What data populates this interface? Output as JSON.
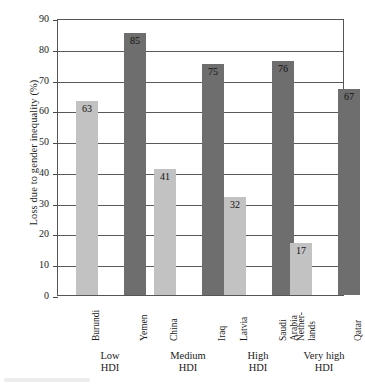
{
  "chart_data": {
    "type": "bar",
    "title": "",
    "xlabel": "",
    "ylabel": "Loss due to gender inequality (%)",
    "ylim": [
      0,
      90
    ],
    "ytick_step": 10,
    "yticks": [
      90,
      80,
      70,
      60,
      50,
      40,
      30,
      20,
      10,
      0
    ],
    "grid": true,
    "legend": "none",
    "categories": [
      "Burundi",
      "Yemen",
      "China",
      "Iraq",
      "Latvia",
      "Saudi\nArabia",
      "Nether-\nlands",
      "Qatar"
    ],
    "values": [
      63,
      85,
      41,
      75,
      32,
      76,
      17,
      67
    ],
    "bar_styles": [
      "light",
      "dark",
      "light",
      "dark",
      "light",
      "dark",
      "light",
      "dark"
    ],
    "groups": [
      {
        "label": "Low\nHDI",
        "categories": [
          "Burundi",
          "Yemen"
        ],
        "values": [
          63,
          85
        ]
      },
      {
        "label": "Medium\nHDI",
        "categories": [
          "China",
          "Iraq"
        ],
        "values": [
          41,
          75
        ]
      },
      {
        "label": "High\nHDI",
        "categories": [
          "Latvia",
          "Saudi Arabia"
        ],
        "values": [
          32,
          76
        ]
      },
      {
        "label": "Very high\nHDI",
        "categories": [
          "Netherlands",
          "Qatar"
        ],
        "values": [
          17,
          67
        ]
      }
    ],
    "colors": {
      "light_bar": "#c2c2c2",
      "dark_bar": "#6e6e6e",
      "axis": "#555555",
      "grid": "#5a5a5a",
      "text": "#1a1a1a",
      "background": "#ffffff"
    }
  },
  "axis": {
    "y_title": "Loss due to gender inequality (%)",
    "tick_labels": [
      "90",
      "80",
      "70",
      "60",
      "50",
      "40",
      "30",
      "20",
      "10",
      "0"
    ]
  },
  "bars": [
    {
      "name": "Burundi",
      "value": 63,
      "value_label": "63",
      "style": "light"
    },
    {
      "name": "Yemen",
      "value": 85,
      "value_label": "85",
      "style": "dark"
    },
    {
      "name": "China",
      "value": 41,
      "value_label": "41",
      "style": "light"
    },
    {
      "name": "Iraq",
      "value": 75,
      "value_label": "75",
      "style": "dark"
    },
    {
      "name": "Latvia",
      "value": 32,
      "value_label": "32",
      "style": "light"
    },
    {
      "name": "Saudi Arabia",
      "value": 76,
      "value_label": "76",
      "style": "dark"
    },
    {
      "name": "Netherlands",
      "value": 17,
      "value_label": "17",
      "style": "light"
    },
    {
      "name": "Qatar",
      "value": 67,
      "value_label": "67",
      "style": "dark"
    }
  ],
  "category_labels": [
    {
      "line1": "Burundi",
      "line2": ""
    },
    {
      "line1": "Yemen",
      "line2": ""
    },
    {
      "line1": "China",
      "line2": ""
    },
    {
      "line1": "Iraq",
      "line2": ""
    },
    {
      "line1": "Latvia",
      "line2": ""
    },
    {
      "line1": "Saudi",
      "line2": "Arabia"
    },
    {
      "line1": "Nether-",
      "line2": "lands"
    },
    {
      "line1": "Qatar",
      "line2": ""
    }
  ],
  "group_labels": [
    {
      "line1": "Low",
      "line2": "HDI"
    },
    {
      "line1": "Medium",
      "line2": "HDI"
    },
    {
      "line1": "High",
      "line2": "HDI"
    },
    {
      "line1": "Very high",
      "line2": "HDI"
    }
  ]
}
